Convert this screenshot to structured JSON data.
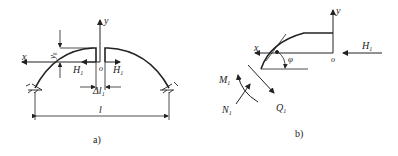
{
  "figure_a": {
    "caption": "a)",
    "labels": {
      "y": "y",
      "x": "x",
      "o": "o",
      "H_left": "H",
      "H_left_sub": "1",
      "H_right": "H",
      "H_right_sub": "1",
      "yk": "y",
      "yk_sub": "k",
      "delta": "Δl",
      "delta_sub": "1",
      "span": "l"
    }
  },
  "figure_b": {
    "caption": "b)",
    "labels": {
      "y": "y",
      "x": "x",
      "o": "o",
      "H": "H",
      "H_sub": "1",
      "phi": "φ",
      "M": "M",
      "M_sub": "1",
      "N": "N",
      "N_sub": "1",
      "Q": "Q",
      "Q_sub": "1"
    }
  }
}
